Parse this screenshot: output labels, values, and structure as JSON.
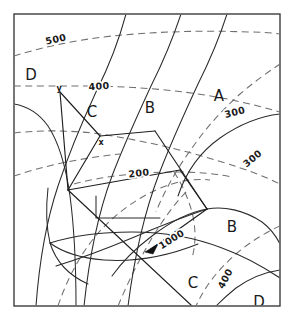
{
  "figure": {
    "name": "contour-map",
    "width": 293,
    "height": 318,
    "frame": {
      "x": 14,
      "y": 14,
      "width": 266,
      "height": 292
    },
    "colors": {
      "background": "#ffffff",
      "frame_stroke": "#3d3d3d",
      "solid_line": "#2b2b2b",
      "survey_line": "#1f1f1f",
      "dashed_contour": "#6f6f6f",
      "label_text": "#1a1a1a",
      "marker_fill": "#111111"
    }
  },
  "zone_labels": [
    {
      "text": "D",
      "x": 31,
      "y": 75
    },
    {
      "text": "C",
      "x": 92,
      "y": 112
    },
    {
      "text": "B",
      "x": 150,
      "y": 108
    },
    {
      "text": "A",
      "x": 219,
      "y": 96
    },
    {
      "text": "B",
      "x": 232,
      "y": 227
    },
    {
      "text": "C",
      "x": 193,
      "y": 283
    },
    {
      "text": "D",
      "x": 259,
      "y": 302
    }
  ],
  "contour_labels": [
    {
      "text": "500",
      "x": 56,
      "y": 40,
      "rotate": -13
    },
    {
      "text": "400",
      "x": 99,
      "y": 87,
      "rotate": -4
    },
    {
      "text": "300",
      "x": 235,
      "y": 113,
      "rotate": -14
    },
    {
      "text": "300",
      "x": 253,
      "y": 159,
      "rotate": -40
    },
    {
      "text": "200",
      "x": 139,
      "y": 174,
      "rotate": -6
    },
    {
      "text": "1000",
      "x": 172,
      "y": 240,
      "rotate": -32
    },
    {
      "text": "400",
      "x": 226,
      "y": 279,
      "rotate": -62
    }
  ],
  "point_labels": [
    {
      "text": "y",
      "x": 59,
      "y": 88
    },
    {
      "text": "x",
      "x": 101,
      "y": 142
    }
  ],
  "markers": [
    {
      "name": "station-marker",
      "type": "filled-triangle",
      "x": 151,
      "y": 249
    }
  ],
  "paths": {
    "solid": [
      "M 126 14 C 118 44 108 68 96 92 C 84 118 70 150 58 186 C 48 216 40 252 36 306",
      "M 14 104 C 26 106 38 112 48 126 C 60 144 66 168 70 196 C 74 226 76 262 76 306",
      "M 181 14 C 173 38 163 62 151 86 C 139 112 125 142 112 176 C 100 208 90 250 84 306",
      "M 227 14 C 220 36 210 60 198 84 C 186 110 172 140 159 174 C 146 208 135 252 128 306",
      "M 280 114 C 262 116 240 124 220 138 C 200 152 186 172 178 196",
      "M 207 209 C 224 206 244 210 262 222 C 270 228 276 236 280 244",
      "M 207 209 C 190 212 170 222 152 236 C 136 248 122 262 112 276",
      "M 50 243 C 72 236 100 232 132 232 C 164 232 196 238 222 248 C 244 256 262 266 280 278",
      "M 207 209 C 186 216 160 226 132 238 C 108 248 82 258 56 266",
      "M 48 188 C 46 206 46 226 50 243 C 56 262 70 276 88 284",
      "M 50 243 C 62 252 80 258 104 260 C 134 262 168 256 198 244",
      "M 96 196 L 96 218 L 160 218",
      "M 280 270 C 266 272 250 278 236 288 C 226 296 220 302 216 306"
    ],
    "survey": [
      "M 60 92 L 100 136",
      "M 100 136 L 155 131",
      "M 155 131 L 207 209",
      "M 100 136 L 68 190",
      "M 68 190 L 180 170",
      "M 68 190 L 192 306",
      "M 180 170 L 207 209",
      "M 151 249 L 207 209",
      "M 60 92 L 68 190"
    ],
    "dashed": [
      "M 14 56 C 40 48 74 40 112 36 C 152 32 200 30 248 32 C 262 32 272 33 280 34",
      "M 14 86 C 36 86 60 86 84 86 C 130 86 180 90 222 98 C 248 103 266 108 280 112",
      "M 14 133 C 40 130 70 130 100 134 C 140 140 184 150 222 162 C 248 170 266 177 280 184",
      "M 74 184 C 104 176 140 172 178 172 C 200 172 218 174 232 177",
      "M 14 176 C 44 166 80 158 120 154",
      "M 280 64 C 268 72 254 82 240 94 C 222 110 206 128 192 148 C 176 170 164 192 156 212",
      "M 280 226 C 266 232 250 242 236 254 C 220 268 206 284 196 306",
      "M 58 306 C 66 282 78 258 94 238 C 112 216 134 200 156 190 C 176 181 194 178 210 180",
      "M 118 306 C 128 282 140 258 152 238 C 164 218 176 202 188 190",
      "M 174 172 C 182 184 188 198 192 212 C 196 228 196 244 192 258"
    ]
  }
}
